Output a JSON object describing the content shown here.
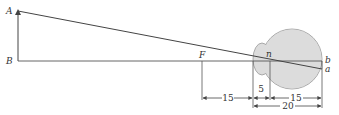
{
  "diagram": {
    "type": "optics-reduced-eye",
    "points": {
      "A": "A",
      "B": "B",
      "F": "F",
      "n": "n",
      "b": "b",
      "a": "a"
    },
    "dimensions": {
      "focal_front": "15",
      "cornea_to_nodal": "5",
      "nodal_to_retina": "15",
      "cornea_to_retina": "20"
    },
    "colors": {
      "line": "#444444",
      "eye_fill": "#dcdcdc",
      "eye_stroke": "#888888"
    }
  }
}
